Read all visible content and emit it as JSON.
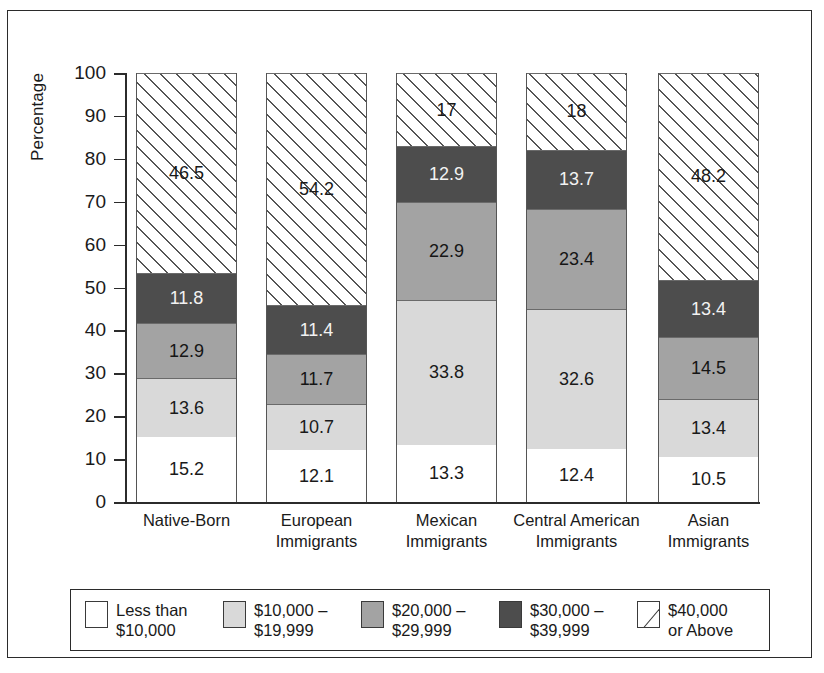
{
  "chart_data": {
    "type": "bar",
    "subtype": "stacked-bar-100",
    "title": "",
    "xlabel": "",
    "ylabel": "Percentage",
    "ylim": [
      0,
      100
    ],
    "yticks": [
      0,
      10,
      20,
      30,
      40,
      50,
      60,
      70,
      80,
      90,
      100
    ],
    "ytick_labels": [
      "0",
      "10",
      "20",
      "30",
      "40",
      "50",
      "60",
      "70",
      "80",
      "90",
      "100"
    ],
    "grid": false,
    "legend_position": "bottom",
    "categories": [
      "Native-Born",
      "European Immigrants",
      "Mexican Immigrants",
      "Central American Immigrants",
      "Asian Immigrants"
    ],
    "category_lines": [
      [
        "Native-Born",
        ""
      ],
      [
        "European",
        "Immigrants"
      ],
      [
        "Mexican",
        "Immigrants"
      ],
      [
        "Central American",
        "Immigrants"
      ],
      [
        "Asian",
        "Immigrants"
      ]
    ],
    "series": [
      {
        "name": "Less than $10,000",
        "legend_lines": [
          "Less than",
          "$10,000"
        ],
        "color": "#ffffff",
        "values": [
          15.2,
          12.1,
          13.3,
          12.4,
          10.5
        ],
        "labels": [
          "15.2",
          "12.1",
          "13.3",
          "12.4",
          "10.5"
        ]
      },
      {
        "name": "$10,000 – $19,999",
        "legend_lines": [
          "$10,000 –",
          "$19,999"
        ],
        "color": "#d9d9d9",
        "values": [
          13.6,
          10.7,
          33.8,
          32.6,
          13.4
        ],
        "labels": [
          "13.6",
          "10.7",
          "33.8",
          "32.6",
          "13.4"
        ]
      },
      {
        "name": "$20,000 – $29,999",
        "legend_lines": [
          "$20,000 –",
          "$29,999"
        ],
        "color": "#a3a3a3",
        "values": [
          12.9,
          11.7,
          22.9,
          23.4,
          14.5
        ],
        "labels": [
          "12.9",
          "11.7",
          "22.9",
          "23.4",
          "14.5"
        ]
      },
      {
        "name": "$30,000 – $39,999",
        "legend_lines": [
          "$30,000 –",
          "$39,999"
        ],
        "color": "#4d4d4d",
        "values": [
          11.8,
          11.4,
          12.9,
          13.7,
          13.4
        ],
        "labels": [
          "11.8",
          "11.4",
          "12.9",
          "13.7",
          "13.4"
        ]
      },
      {
        "name": "$40,000 or Above",
        "legend_lines": [
          "$40,000",
          "or Above"
        ],
        "color": "hatch",
        "values": [
          46.5,
          54.2,
          17.0,
          18.0,
          48.2
        ],
        "labels": [
          "46.5",
          "54.2",
          "17",
          "18",
          "48.2"
        ]
      }
    ]
  }
}
